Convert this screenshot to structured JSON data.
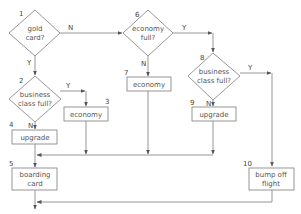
{
  "diagram": {
    "type": "flowchart",
    "colors": {
      "stroke": "#8a8a8a",
      "text": "#555555",
      "background": "#ffffff"
    },
    "nodes": [
      {
        "id": "1",
        "number": "1",
        "shape": "decision",
        "lines": [
          "gold",
          "card?"
        ]
      },
      {
        "id": "2",
        "number": "2",
        "shape": "decision",
        "lines": [
          "business",
          "class full?"
        ]
      },
      {
        "id": "3",
        "number": "3",
        "shape": "process",
        "lines": [
          "economy"
        ]
      },
      {
        "id": "4",
        "number": "4",
        "shape": "process",
        "lines": [
          "upgrade"
        ]
      },
      {
        "id": "5",
        "number": "5",
        "shape": "process",
        "lines": [
          "boarding",
          "card"
        ]
      },
      {
        "id": "6",
        "number": "6",
        "shape": "decision",
        "lines": [
          "economy",
          "full?"
        ]
      },
      {
        "id": "7",
        "number": "7",
        "shape": "process",
        "lines": [
          "economy"
        ]
      },
      {
        "id": "8",
        "number": "8",
        "shape": "decision",
        "lines": [
          "business",
          "class full?"
        ]
      },
      {
        "id": "9",
        "number": "9",
        "shape": "process",
        "lines": [
          "upgrade"
        ]
      },
      {
        "id": "10",
        "number": "10",
        "shape": "process",
        "lines": [
          "bump off",
          "flight"
        ]
      }
    ],
    "edges": [
      {
        "from": "1",
        "to": "6",
        "label": "N"
      },
      {
        "from": "1",
        "to": "2",
        "label": "Y"
      },
      {
        "from": "2",
        "to": "3",
        "label": "Y"
      },
      {
        "from": "2",
        "to": "4",
        "label": "N"
      },
      {
        "from": "6",
        "to": "8",
        "label": "Y"
      },
      {
        "from": "6",
        "to": "7",
        "label": "N"
      },
      {
        "from": "8",
        "to": "10",
        "label": "Y"
      },
      {
        "from": "8",
        "to": "9",
        "label": "N"
      },
      {
        "from": "4",
        "to": "5",
        "label": ""
      },
      {
        "from": "3",
        "to": "5",
        "label": ""
      },
      {
        "from": "7",
        "to": "5",
        "label": ""
      },
      {
        "from": "9",
        "to": "5",
        "label": ""
      },
      {
        "from": "5",
        "to": "end",
        "label": ""
      },
      {
        "from": "10",
        "to": "end",
        "label": ""
      }
    ]
  }
}
